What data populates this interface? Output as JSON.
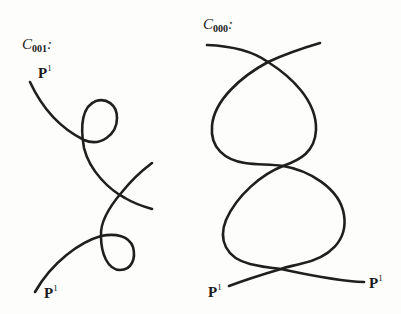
{
  "figure": {
    "left": {
      "name": "C",
      "subscript": "001",
      "suffix": ":",
      "endpoint_labels": [
        {
          "base": "P",
          "sup": "1"
        },
        {
          "base": "P",
          "sup": "1"
        }
      ]
    },
    "right": {
      "name": "C",
      "subscript": "000",
      "suffix": ":",
      "endpoint_labels": [
        {
          "base": "P",
          "sup": "1"
        },
        {
          "base": "P",
          "sup": "1"
        }
      ]
    }
  },
  "colors": {
    "stroke": "#1f1f1f",
    "background": "#fdfdfb"
  }
}
